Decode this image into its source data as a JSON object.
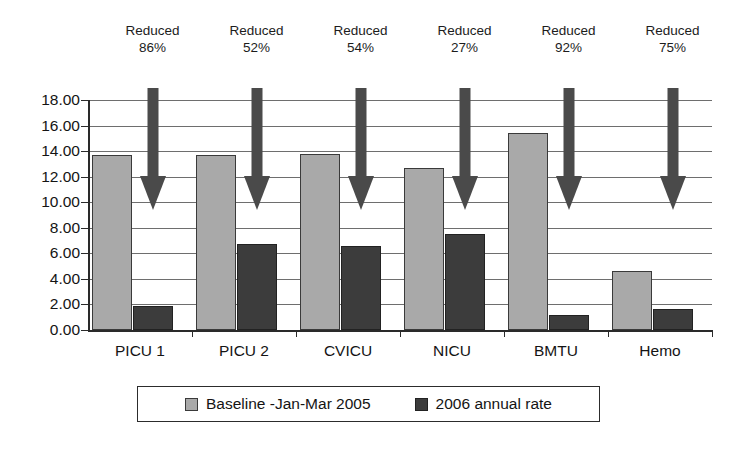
{
  "chart_data": {
    "type": "bar",
    "title": "",
    "subtitle": "",
    "xlabel": "",
    "ylabel": "",
    "categories": [
      "PICU 1",
      "PICU 2",
      "CVICU",
      "NICU",
      "BMTU",
      "Hemo"
    ],
    "series": [
      {
        "name": "Baseline -Jan-Mar 2005",
        "color": "#a9a9a9",
        "values": [
          13.7,
          13.7,
          13.8,
          12.7,
          15.4,
          4.6
        ]
      },
      {
        "name": "2006 annual rate",
        "color": "#3c3c3c",
        "values": [
          1.9,
          6.7,
          6.6,
          7.5,
          1.2,
          1.65
        ]
      }
    ],
    "ylim": [
      0,
      18
    ],
    "ytick_step": 2,
    "ytick_labels": [
      "18.00",
      "16.00",
      "14.00",
      "12.00",
      "10.00",
      "8.00",
      "6.00",
      "4.00",
      "2.00",
      "0.00"
    ],
    "ytick_values": [
      18,
      16,
      14,
      12,
      10,
      8,
      6,
      4,
      2,
      0
    ],
    "grid": true,
    "legend_position": "bottom",
    "annotations": [
      {
        "line1": "Reduced",
        "line2": "86%",
        "category": "PICU 1",
        "marker": "down-arrow"
      },
      {
        "line1": "Reduced",
        "line2": "52%",
        "category": "PICU 2",
        "marker": "down-arrow"
      },
      {
        "line1": "Reduced",
        "line2": "54%",
        "category": "CVICU",
        "marker": "down-arrow"
      },
      {
        "line1": "Reduced",
        "line2": "27%",
        "category": "NICU",
        "marker": "down-arrow"
      },
      {
        "line1": "Reduced",
        "line2": "92%",
        "category": "BMTU",
        "marker": "down-arrow"
      },
      {
        "line1": "Reduced",
        "line2": "75%",
        "category": "Hemo",
        "marker": "down-arrow"
      }
    ]
  }
}
